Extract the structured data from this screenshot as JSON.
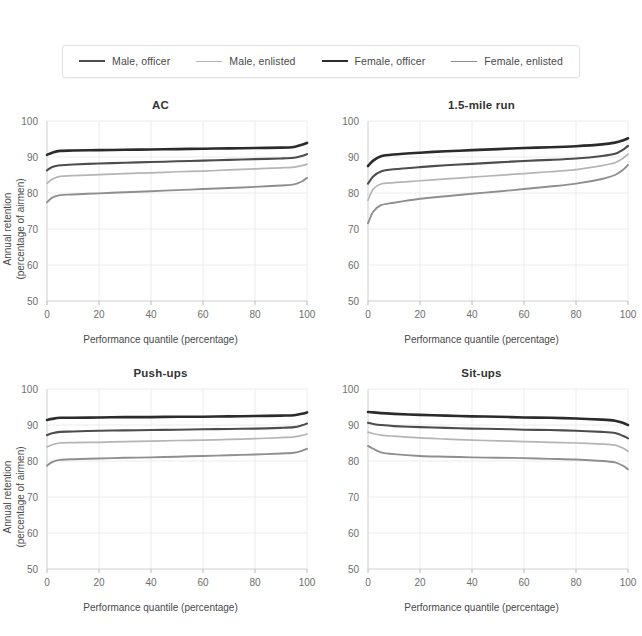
{
  "legend": {
    "position": "top-center",
    "items": [
      {
        "label": "Male, officer",
        "color": "#4d4d4d",
        "width": 2.1
      },
      {
        "label": "Male, enlisted",
        "color": "#b5b5b5",
        "width": 1.7
      },
      {
        "label": "Female, officer",
        "color": "#2b2b2b",
        "width": 2.6
      },
      {
        "label": "Female, enlisted",
        "color": "#8f8f8f",
        "width": 1.9
      }
    ]
  },
  "axes": {
    "xlabel": "Performance quantile (percentage)",
    "ylabel_line1": "Annual retention",
    "ylabel_line2": "(percentage of airmen)",
    "xticks": [
      "0",
      "20",
      "40",
      "60",
      "80",
      "100"
    ],
    "yticks": [
      "50",
      "60",
      "70",
      "80",
      "90",
      "100"
    ],
    "xlim": [
      0,
      100
    ],
    "ylim": [
      50,
      100
    ]
  },
  "chart_data": [
    {
      "type": "line",
      "title": "AC",
      "xlabel": "Performance quantile (percentage)",
      "ylabel": "Annual retention (percentage of airmen)",
      "xlim": [
        0,
        100
      ],
      "ylim": [
        50,
        100
      ],
      "grid": true,
      "legend": "top-center",
      "x": [
        0,
        2,
        5,
        10,
        20,
        30,
        40,
        50,
        60,
        70,
        80,
        90,
        95,
        98,
        100
      ],
      "series": [
        {
          "name": "Female, officer",
          "color": "#2b2b2b",
          "values": [
            90.6,
            91.2,
            91.7,
            91.8,
            91.9,
            92.0,
            92.1,
            92.2,
            92.3,
            92.4,
            92.5,
            92.6,
            92.8,
            93.4,
            93.9
          ]
        },
        {
          "name": "Male, officer",
          "color": "#4d4d4d",
          "values": [
            86.3,
            87.2,
            87.7,
            87.9,
            88.2,
            88.4,
            88.6,
            88.8,
            89.0,
            89.2,
            89.4,
            89.6,
            89.8,
            90.3,
            90.8
          ]
        },
        {
          "name": "Male, enlisted",
          "color": "#b5b5b5",
          "values": [
            82.7,
            83.8,
            84.6,
            84.8,
            85.1,
            85.4,
            85.6,
            85.9,
            86.1,
            86.4,
            86.7,
            87.0,
            87.2,
            87.6,
            88.0
          ]
        },
        {
          "name": "Female, enlisted",
          "color": "#8f8f8f",
          "values": [
            77.4,
            78.7,
            79.4,
            79.6,
            79.9,
            80.2,
            80.5,
            80.8,
            81.1,
            81.4,
            81.7,
            82.1,
            82.4,
            83.2,
            84.2
          ]
        }
      ]
    },
    {
      "type": "line",
      "title": "1.5-mile run",
      "xlabel": "Performance quantile (percentage)",
      "ylabel": "Annual retention (percentage of airmen)",
      "xlim": [
        0,
        100
      ],
      "ylim": [
        50,
        100
      ],
      "grid": true,
      "x": [
        0,
        2,
        5,
        10,
        20,
        30,
        40,
        50,
        60,
        70,
        80,
        90,
        95,
        98,
        100
      ],
      "series": [
        {
          "name": "Female, officer",
          "color": "#2b2b2b",
          "values": [
            87.5,
            89.0,
            90.2,
            90.7,
            91.2,
            91.6,
            91.9,
            92.2,
            92.5,
            92.7,
            93.0,
            93.5,
            94.0,
            94.6,
            95.2
          ]
        },
        {
          "name": "Male, officer",
          "color": "#4d4d4d",
          "values": [
            82.6,
            84.6,
            86.0,
            86.6,
            87.2,
            87.7,
            88.1,
            88.5,
            88.9,
            89.2,
            89.6,
            90.3,
            90.9,
            92.0,
            93.1
          ]
        },
        {
          "name": "Male, enlisted",
          "color": "#b5b5b5",
          "values": [
            78.0,
            81.1,
            82.5,
            82.9,
            83.4,
            83.9,
            84.4,
            84.9,
            85.4,
            85.9,
            86.5,
            87.6,
            88.4,
            89.6,
            90.8
          ]
        },
        {
          "name": "Female, enlisted",
          "color": "#8f8f8f",
          "values": [
            71.6,
            74.8,
            76.6,
            77.3,
            78.4,
            79.1,
            79.8,
            80.4,
            81.1,
            81.8,
            82.6,
            83.9,
            85.0,
            86.4,
            87.8
          ]
        }
      ]
    },
    {
      "type": "line",
      "title": "Push-ups",
      "xlabel": "Performance quantile (percentage)",
      "ylabel": "Annual retention (percentage of airmen)",
      "xlim": [
        0,
        100
      ],
      "ylim": [
        50,
        100
      ],
      "grid": true,
      "x": [
        0,
        2,
        5,
        10,
        20,
        30,
        40,
        50,
        60,
        70,
        80,
        90,
        95,
        98,
        100
      ],
      "series": [
        {
          "name": "Female, officer",
          "color": "#2b2b2b",
          "values": [
            91.4,
            91.7,
            92.0,
            92.0,
            92.1,
            92.2,
            92.2,
            92.3,
            92.3,
            92.4,
            92.5,
            92.6,
            92.7,
            93.1,
            93.5
          ]
        },
        {
          "name": "Male, officer",
          "color": "#4d4d4d",
          "values": [
            87.2,
            87.7,
            88.1,
            88.2,
            88.4,
            88.5,
            88.6,
            88.7,
            88.8,
            88.9,
            89.0,
            89.2,
            89.4,
            89.9,
            90.4
          ]
        },
        {
          "name": "Male, enlisted",
          "color": "#b5b5b5",
          "values": [
            83.9,
            84.5,
            85.0,
            85.1,
            85.2,
            85.4,
            85.5,
            85.7,
            85.8,
            86.0,
            86.2,
            86.5,
            86.7,
            87.1,
            87.5
          ]
        },
        {
          "name": "Female, enlisted",
          "color": "#8f8f8f",
          "values": [
            78.7,
            79.7,
            80.3,
            80.5,
            80.7,
            80.9,
            81.0,
            81.2,
            81.4,
            81.6,
            81.8,
            82.1,
            82.3,
            82.8,
            83.4
          ]
        }
      ]
    },
    {
      "type": "line",
      "title": "Sit-ups",
      "xlabel": "Performance quantile (percentage)",
      "ylabel": "Annual retention (percentage of airmen)",
      "xlim": [
        0,
        100
      ],
      "ylim": [
        50,
        100
      ],
      "grid": true,
      "x": [
        0,
        2,
        5,
        10,
        20,
        30,
        40,
        50,
        60,
        70,
        80,
        90,
        95,
        98,
        100
      ],
      "series": [
        {
          "name": "Female, officer",
          "color": "#2b2b2b",
          "values": [
            93.6,
            93.5,
            93.3,
            93.1,
            92.8,
            92.6,
            92.4,
            92.3,
            92.1,
            92.0,
            91.8,
            91.5,
            91.2,
            90.6,
            90.0
          ]
        },
        {
          "name": "Male, officer",
          "color": "#4d4d4d",
          "values": [
            90.6,
            90.3,
            90.0,
            89.7,
            89.4,
            89.2,
            89.0,
            88.9,
            88.7,
            88.6,
            88.4,
            88.1,
            87.8,
            87.0,
            86.3
          ]
        },
        {
          "name": "Male, enlisted",
          "color": "#b5b5b5",
          "values": [
            88.0,
            87.6,
            87.2,
            86.9,
            86.4,
            86.1,
            85.8,
            85.6,
            85.4,
            85.2,
            85.0,
            84.7,
            84.4,
            83.6,
            82.7
          ]
        },
        {
          "name": "Female, enlisted",
          "color": "#8f8f8f",
          "values": [
            84.2,
            83.4,
            82.4,
            81.9,
            81.4,
            81.2,
            81.0,
            80.9,
            80.8,
            80.6,
            80.4,
            80.0,
            79.6,
            78.7,
            77.7
          ]
        }
      ]
    }
  ]
}
